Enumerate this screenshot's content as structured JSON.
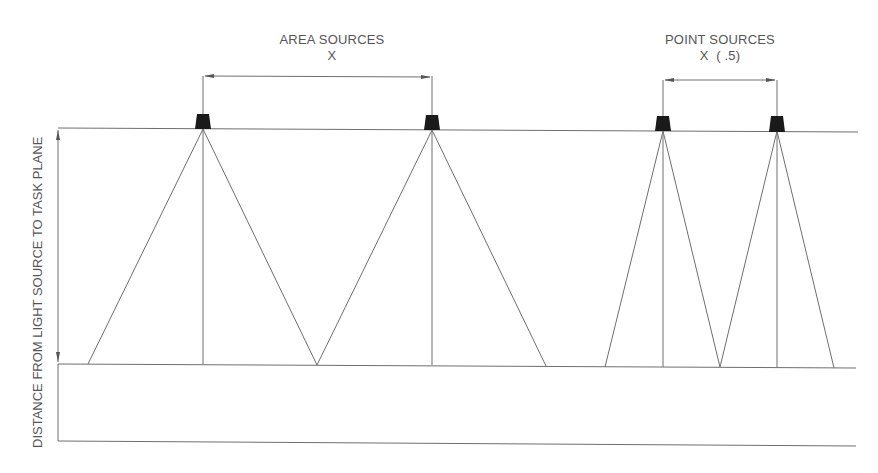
{
  "diagram": {
    "area_sources": {
      "title": "AREA SOURCES",
      "spacing": "X",
      "fixture_x": [
        203,
        432
      ],
      "cone_bases": [
        [
          88,
          317
        ],
        [
          317,
          546
        ]
      ]
    },
    "point_sources": {
      "title": "POINT SOURCES",
      "spacing": "X  ( .5)",
      "fixture_x": [
        663,
        777
      ],
      "cone_bases": [
        [
          605,
          720
        ],
        [
          720,
          834
        ]
      ]
    },
    "vertical_dimension": "DISTANCE FROM LIGHT SOURCE TO TASK PLANE",
    "colors": {
      "line": "#6e6e6e",
      "fixture": "#1a1a1a",
      "text": "#555555"
    }
  }
}
